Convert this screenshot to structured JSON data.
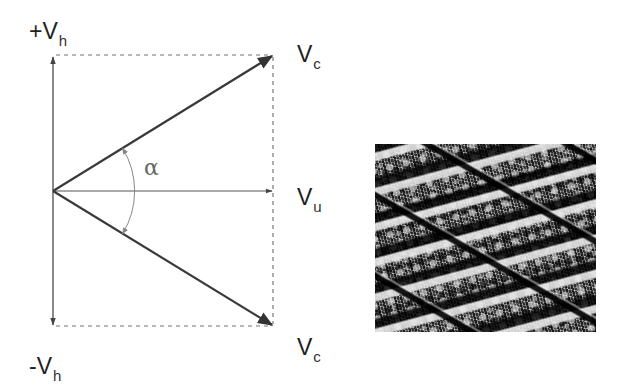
{
  "diagram": {
    "type": "velocity-vector-diagram",
    "labels": {
      "plus_vh": {
        "main": "+V",
        "sub": "h"
      },
      "minus_vh": {
        "main": "-V",
        "sub": "h"
      },
      "vc_top": {
        "main": "V",
        "sub": "c"
      },
      "vu": {
        "main": "V",
        "sub": "u"
      },
      "vc_bottom": {
        "main": "V",
        "sub": "c"
      },
      "angle": "α"
    },
    "vectors": [
      {
        "name": "vertical-axis-up",
        "label": "+Vh",
        "from": [
          53,
          191
        ],
        "to": [
          53,
          55
        ]
      },
      {
        "name": "vertical-axis-down",
        "label": "-Vh",
        "from": [
          53,
          191
        ],
        "to": [
          53,
          326
        ]
      },
      {
        "name": "vu-vector",
        "label": "Vu",
        "from": [
          53,
          191
        ],
        "to": [
          273,
          191
        ]
      },
      {
        "name": "vc-upper-vector",
        "label": "Vc",
        "from": [
          53,
          191
        ],
        "to": [
          273,
          55
        ]
      },
      {
        "name": "vc-lower-vector",
        "label": "Vc",
        "from": [
          53,
          191
        ],
        "to": [
          273,
          326
        ]
      }
    ],
    "angle_arc": {
      "label": "α",
      "center": [
        53,
        191
      ],
      "radius": 82,
      "between": [
        "vc-upper-vector",
        "vc-lower-vector"
      ]
    },
    "dashed_box": {
      "left": 53,
      "top": 55,
      "right": 273,
      "bottom": 326
    },
    "colors": {
      "vector": "#3a3a3a",
      "axis": "#4a4a4a",
      "dashed": "#777777",
      "arc": "#8a8a8a",
      "text": "#1e1e1e"
    }
  },
  "micrograph": {
    "description": "cross-hatched honed surface texture",
    "alt": "surface micrograph"
  }
}
